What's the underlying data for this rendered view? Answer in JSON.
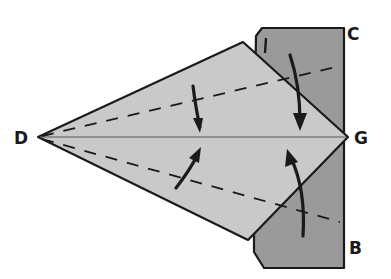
{
  "diagram": {
    "type": "origami-folding-step",
    "labels": {
      "D": "D",
      "G": "G",
      "C": "C",
      "B": "B"
    },
    "colors": {
      "light_paper": "#c9c9c9",
      "dark_paper": "#9a9a9a",
      "line": "#1a1a1a",
      "background": "#ffffff"
    },
    "arrows": [
      {
        "name": "fold-down-upper-left",
        "direction": "down"
      },
      {
        "name": "fold-down-upper-right",
        "direction": "down"
      },
      {
        "name": "fold-up-lower-left",
        "direction": "up"
      },
      {
        "name": "fold-up-lower-right",
        "direction": "up"
      }
    ],
    "fold_lines": [
      "upper-valley-fold",
      "lower-valley-fold"
    ],
    "center_line": "D-G"
  }
}
